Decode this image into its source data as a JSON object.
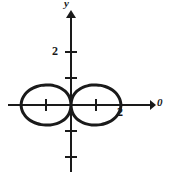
{
  "figure": {
    "background_color": "#ffffff",
    "stroke_color": "#1a1a1a",
    "axis_label_y": "y",
    "axis_label_x": "0",
    "y_tick_label": "2",
    "x_tick_label": "2"
  },
  "chart_data": {
    "type": "line",
    "title": "",
    "xlabel": "0",
    "ylabel": "y",
    "grid": false,
    "legend": null,
    "xlim": [
      -2.8,
      3.9
    ],
    "ylim": [
      -2.8,
      2.8
    ],
    "origin_px": [
      71,
      105
    ],
    "unit_px": {
      "x": 25,
      "y": 26
    },
    "x_ticks": [
      -1,
      1
    ],
    "x_tick_labels": [
      "",
      ""
    ],
    "y_ticks": [
      2,
      1,
      -1,
      -2
    ],
    "y_tick_labels": [
      "2",
      "",
      "",
      ""
    ],
    "labeled_points": [
      {
        "label": "2",
        "x": 2.0,
        "y": -0.28
      },
      {
        "label": "2",
        "x": -0.76,
        "y": 2.0
      }
    ],
    "curve": {
      "name": "lemniscate-of-bernoulli",
      "equation": "(x^2 + y^2)^2 = 4(x^2 - y^2)",
      "a": 2.0,
      "x_range": [
        -2.0,
        2.0
      ],
      "y_range": [
        -1.0,
        1.0
      ],
      "linewidth_px": 3,
      "closed": true,
      "points": [
        [
          2.0,
          0.0
        ],
        [
          1.98,
          0.141
        ],
        [
          1.93,
          0.277
        ],
        [
          1.85,
          0.403
        ],
        [
          1.74,
          0.516
        ],
        [
          1.6,
          0.612
        ],
        [
          1.45,
          0.687
        ],
        [
          1.28,
          0.74
        ],
        [
          1.1,
          0.769
        ],
        [
          0.92,
          0.774
        ],
        [
          0.74,
          0.756
        ],
        [
          0.57,
          0.716
        ],
        [
          0.42,
          0.656
        ],
        [
          0.29,
          0.578
        ],
        [
          0.18,
          0.483
        ],
        [
          0.1,
          0.373
        ],
        [
          0.04,
          0.251
        ],
        [
          0.01,
          0.123
        ],
        [
          0.0,
          0.0
        ],
        [
          -0.01,
          -0.123
        ],
        [
          -0.04,
          -0.251
        ],
        [
          -0.1,
          -0.373
        ],
        [
          -0.18,
          -0.483
        ],
        [
          -0.29,
          -0.578
        ],
        [
          -0.42,
          -0.656
        ],
        [
          -0.57,
          -0.716
        ],
        [
          -0.74,
          -0.756
        ],
        [
          -0.92,
          -0.774
        ],
        [
          -1.1,
          -0.769
        ],
        [
          -1.28,
          -0.74
        ],
        [
          -1.45,
          -0.687
        ],
        [
          -1.6,
          -0.612
        ],
        [
          -1.74,
          -0.516
        ],
        [
          -1.85,
          -0.403
        ],
        [
          -1.93,
          -0.277
        ],
        [
          -1.98,
          -0.141
        ],
        [
          -2.0,
          0.0
        ],
        [
          -1.98,
          0.141
        ],
        [
          -1.93,
          0.277
        ],
        [
          -1.85,
          0.403
        ],
        [
          -1.74,
          0.516
        ],
        [
          -1.6,
          0.612
        ],
        [
          -1.45,
          0.687
        ],
        [
          -1.28,
          0.74
        ],
        [
          -1.1,
          0.769
        ],
        [
          -0.92,
          0.774
        ],
        [
          -0.74,
          0.756
        ],
        [
          -0.57,
          0.716
        ],
        [
          -0.42,
          0.656
        ],
        [
          -0.29,
          0.578
        ],
        [
          -0.18,
          0.483
        ],
        [
          -0.1,
          0.373
        ],
        [
          -0.04,
          0.251
        ],
        [
          -0.01,
          0.123
        ],
        [
          0.0,
          0.0
        ],
        [
          0.01,
          -0.123
        ],
        [
          0.04,
          -0.251
        ],
        [
          0.1,
          -0.373
        ],
        [
          0.18,
          -0.483
        ],
        [
          0.29,
          -0.578
        ],
        [
          0.42,
          -0.656
        ],
        [
          0.57,
          -0.716
        ],
        [
          0.74,
          -0.756
        ],
        [
          0.92,
          -0.774
        ],
        [
          1.1,
          -0.769
        ],
        [
          1.28,
          -0.74
        ],
        [
          1.45,
          -0.687
        ],
        [
          1.6,
          -0.612
        ],
        [
          1.74,
          -0.516
        ],
        [
          1.85,
          -0.403
        ],
        [
          1.93,
          -0.277
        ],
        [
          1.98,
          -0.141
        ],
        [
          2.0,
          0.0
        ]
      ]
    }
  }
}
